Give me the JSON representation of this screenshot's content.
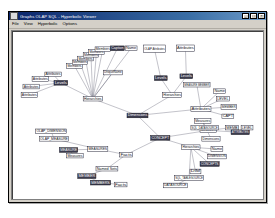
{
  "window": {
    "title": "Graphs OLAP SQL - Hyperbolic Viewer",
    "icon": "app-icon",
    "buttons": [
      {
        "name": "minimize-button",
        "glyph": "_"
      },
      {
        "name": "maximize-button",
        "glyph": "□"
      },
      {
        "name": "close-button",
        "glyph": "×"
      }
    ]
  },
  "menu": {
    "items": [
      {
        "name": "menu-file",
        "label": "File"
      },
      {
        "name": "menu-view",
        "label": "View"
      },
      {
        "name": "menu-hyperbolic",
        "label": "Hyperbolic"
      },
      {
        "name": "menu-options",
        "label": "Options"
      }
    ]
  },
  "graph": {
    "type": "hyperbolic-tree",
    "root": "Dimensions",
    "nodes": [
      {
        "id": "n0",
        "label": "Dimensions",
        "x": 126,
        "y": 88,
        "w": 23,
        "h": 5,
        "selected": true
      },
      {
        "id": "n1",
        "label": "Hierarchies",
        "x": 78,
        "y": 70,
        "w": 21,
        "h": 5,
        "selected": false
      },
      {
        "id": "n2",
        "label": "Levels",
        "x": 46,
        "y": 53,
        "w": 15,
        "h": 5,
        "selected": true
      },
      {
        "id": "n3",
        "label": "Attributes",
        "x": 36,
        "y": 44,
        "w": 18,
        "h": 5,
        "selected": false
      },
      {
        "id": "n4",
        "label": "Attributes",
        "x": 22,
        "y": 49,
        "w": 18,
        "h": 5,
        "selected": false
      },
      {
        "id": "n5",
        "label": "Attributes",
        "x": 12,
        "y": 57,
        "w": 18,
        "h": 5,
        "selected": false
      },
      {
        "id": "n6",
        "label": "Attributes",
        "x": 10,
        "y": 66,
        "w": 18,
        "h": 5,
        "selected": false
      },
      {
        "id": "n7",
        "label": "Members",
        "x": 60,
        "y": 35,
        "w": 17,
        "h": 5,
        "selected": false
      },
      {
        "id": "n8",
        "label": "Members",
        "x": 66,
        "y": 31,
        "w": 17,
        "h": 5,
        "selected": false
      },
      {
        "id": "n9",
        "label": "Members",
        "x": 72,
        "y": 27,
        "w": 17,
        "h": 5,
        "selected": false
      },
      {
        "id": "n10",
        "label": "Members",
        "x": 78,
        "y": 23,
        "w": 17,
        "h": 5,
        "selected": false
      },
      {
        "id": "n11",
        "label": "Members",
        "x": 84,
        "y": 20,
        "w": 17,
        "h": 5,
        "selected": false
      },
      {
        "id": "n12",
        "label": "Members",
        "x": 91,
        "y": 17,
        "w": 17,
        "h": 5,
        "selected": false
      },
      {
        "id": "n13",
        "label": "Caption",
        "x": 108,
        "y": 16,
        "w": 15,
        "h": 5,
        "selected": true
      },
      {
        "id": "n14",
        "label": "Name",
        "x": 124,
        "y": 16,
        "w": 13,
        "h": 5,
        "selected": false
      },
      {
        "id": "n15",
        "label": "UniqueName",
        "x": 100,
        "y": 42,
        "w": 21,
        "h": 5,
        "selected": false
      },
      {
        "id": "n16",
        "label": "Hierarchies",
        "x": 165,
        "y": 66,
        "w": 21,
        "h": 5,
        "selected": false
      },
      {
        "id": "n17",
        "label": "Levels",
        "x": 156,
        "y": 48,
        "w": 14,
        "h": 5,
        "selected": true
      },
      {
        "id": "n18",
        "label": "Levels",
        "x": 184,
        "y": 46,
        "w": 14,
        "h": 5,
        "selected": true
      },
      {
        "id": "n19",
        "label": "OLAP Attributes",
        "x": 144,
        "y": 15,
        "w": 24,
        "h": 8,
        "selected": false
      },
      {
        "id": "n20",
        "label": "Attributes",
        "x": 180,
        "y": 15,
        "w": 20,
        "h": 7,
        "selected": false
      },
      {
        "id": "n21",
        "label": "Attributes",
        "x": 196,
        "y": 81,
        "w": 22,
        "h": 5,
        "selected": false
      },
      {
        "id": "n22",
        "label": "MEASURE MEMBER",
        "x": 188,
        "y": 55,
        "w": 29,
        "h": 5,
        "selected": false
      },
      {
        "id": "n23",
        "label": "Name",
        "x": 221,
        "y": 62,
        "w": 13,
        "h": 5,
        "selected": false
      },
      {
        "id": "n24",
        "label": "LEVEL",
        "x": 224,
        "y": 70,
        "w": 14,
        "h": 5,
        "selected": false
      },
      {
        "id": "n25",
        "label": "MEMBER",
        "x": 229,
        "y": 79,
        "w": 17,
        "h": 5,
        "selected": false
      },
      {
        "id": "n26",
        "label": "CAPT",
        "x": 230,
        "y": 89,
        "w": 13,
        "h": 5,
        "selected": false
      },
      {
        "id": "n27",
        "label": "Measures",
        "x": 206,
        "y": 104,
        "w": 18,
        "h": 5,
        "selected": false
      },
      {
        "id": "n28",
        "label": "MEMB",
        "x": 234,
        "y": 101,
        "w": 14,
        "h": 5,
        "selected": false
      },
      {
        "id": "n29",
        "label": "ATTRIBUTES",
        "x": 240,
        "y": 106,
        "w": 20,
        "h": 5,
        "selected": true
      },
      {
        "id": "n30",
        "label": "LEVEL",
        "x": 251,
        "y": 101,
        "w": 13,
        "h": 5,
        "selected": false
      },
      {
        "id": "n31",
        "label": "Dimensions",
        "x": 208,
        "y": 113,
        "w": 20,
        "h": 5,
        "selected": false
      },
      {
        "id": "n32",
        "label": "CONCEPT",
        "x": 152,
        "y": 112,
        "w": 21,
        "h": 5,
        "selected": true
      },
      {
        "id": "n33",
        "label": "Hierarchies",
        "x": 186,
        "y": 122,
        "w": 20,
        "h": 5,
        "selected": false
      },
      {
        "id": "n34",
        "label": "Name",
        "x": 218,
        "y": 124,
        "w": 13,
        "h": 5,
        "selected": false
      },
      {
        "id": "n35",
        "label": "DIMENSION",
        "x": 214,
        "y": 132,
        "w": 21,
        "h": 5,
        "selected": false
      },
      {
        "id": "n36",
        "label": "CONCEPTS",
        "x": 206,
        "y": 140,
        "w": 21,
        "h": 5,
        "selected": true
      },
      {
        "id": "n37",
        "label": "DIM",
        "x": 195,
        "y": 148,
        "w": 12,
        "h": 5,
        "selected": false
      },
      {
        "id": "n38",
        "label": "Facts",
        "x": 118,
        "y": 130,
        "w": 14,
        "h": 5,
        "selected": false
      },
      {
        "id": "n39",
        "label": "MEASURES",
        "x": 83,
        "y": 124,
        "w": 22,
        "h": 5,
        "selected": false
      },
      {
        "id": "n40",
        "label": "OLAP_MEASURE",
        "x": 30,
        "y": 113,
        "w": 32,
        "h": 5,
        "selected": false
      },
      {
        "id": "n41",
        "label": "OLAP_DIMENSION",
        "x": 26,
        "y": 105,
        "w": 34,
        "h": 5,
        "selected": false
      },
      {
        "id": "n42",
        "label": "MEASURE",
        "x": 52,
        "y": 125,
        "w": 20,
        "h": 5,
        "selected": true
      },
      {
        "id": "n43",
        "label": "Measures",
        "x": 60,
        "y": 131,
        "w": 18,
        "h": 5,
        "selected": false
      },
      {
        "id": "n44",
        "label": "Named Sets",
        "x": 92,
        "y": 145,
        "w": 24,
        "h": 5,
        "selected": false
      },
      {
        "id": "n45",
        "label": "MEMBER",
        "x": 72,
        "y": 153,
        "w": 20,
        "h": 5,
        "selected": true
      },
      {
        "id": "n46",
        "label": "MEMBERS",
        "x": 86,
        "y": 160,
        "w": 22,
        "h": 5,
        "selected": true
      },
      {
        "id": "n47",
        "label": "Facts",
        "x": 112,
        "y": 162,
        "w": 14,
        "h": 5,
        "selected": false
      },
      {
        "id": "n48",
        "label": "Measures",
        "x": 200,
        "y": 94,
        "w": 18,
        "h": 5,
        "selected": false
      },
      {
        "id": "n49",
        "label": "SQL_DATASOURCE",
        "x": 196,
        "y": 101,
        "w": 30,
        "h": 5,
        "selected": false
      },
      {
        "id": "n50",
        "label": "SQL_TABLESOURCE",
        "x": 178,
        "y": 155,
        "w": 32,
        "h": 5,
        "selected": false
      },
      {
        "id": "n51",
        "label": "DATASOURCE",
        "x": 166,
        "y": 163,
        "w": 26,
        "h": 5,
        "selected": false
      }
    ],
    "edges": [
      [
        "n0",
        "n1"
      ],
      [
        "n1",
        "n2"
      ],
      [
        "n2",
        "n3"
      ],
      [
        "n2",
        "n4"
      ],
      [
        "n2",
        "n5"
      ],
      [
        "n2",
        "n6"
      ],
      [
        "n1",
        "n7"
      ],
      [
        "n1",
        "n8"
      ],
      [
        "n1",
        "n9"
      ],
      [
        "n1",
        "n10"
      ],
      [
        "n1",
        "n11"
      ],
      [
        "n1",
        "n12"
      ],
      [
        "n1",
        "n13"
      ],
      [
        "n1",
        "n14"
      ],
      [
        "n1",
        "n15"
      ],
      [
        "n0",
        "n16"
      ],
      [
        "n16",
        "n17"
      ],
      [
        "n16",
        "n18"
      ],
      [
        "n17",
        "n19"
      ],
      [
        "n18",
        "n20"
      ],
      [
        "n0",
        "n21"
      ],
      [
        "n21",
        "n22"
      ],
      [
        "n21",
        "n23"
      ],
      [
        "n21",
        "n24"
      ],
      [
        "n21",
        "n25"
      ],
      [
        "n21",
        "n26"
      ],
      [
        "n0",
        "n32"
      ],
      [
        "n32",
        "n27"
      ],
      [
        "n27",
        "n28"
      ],
      [
        "n27",
        "n29"
      ],
      [
        "n29",
        "n30"
      ],
      [
        "n32",
        "n33"
      ],
      [
        "n33",
        "n34"
      ],
      [
        "n33",
        "n35"
      ],
      [
        "n33",
        "n36"
      ],
      [
        "n33",
        "n37"
      ],
      [
        "n32",
        "n38"
      ],
      [
        "n38",
        "n39"
      ],
      [
        "n39",
        "n40"
      ],
      [
        "n40",
        "n41"
      ],
      [
        "n39",
        "n42"
      ],
      [
        "n42",
        "n43"
      ],
      [
        "n38",
        "n44"
      ],
      [
        "n44",
        "n45"
      ],
      [
        "n45",
        "n46"
      ],
      [
        "n46",
        "n47"
      ],
      [
        "n31",
        "n48"
      ],
      [
        "n48",
        "n49"
      ],
      [
        "n33",
        "n50"
      ],
      [
        "n50",
        "n51"
      ]
    ]
  }
}
